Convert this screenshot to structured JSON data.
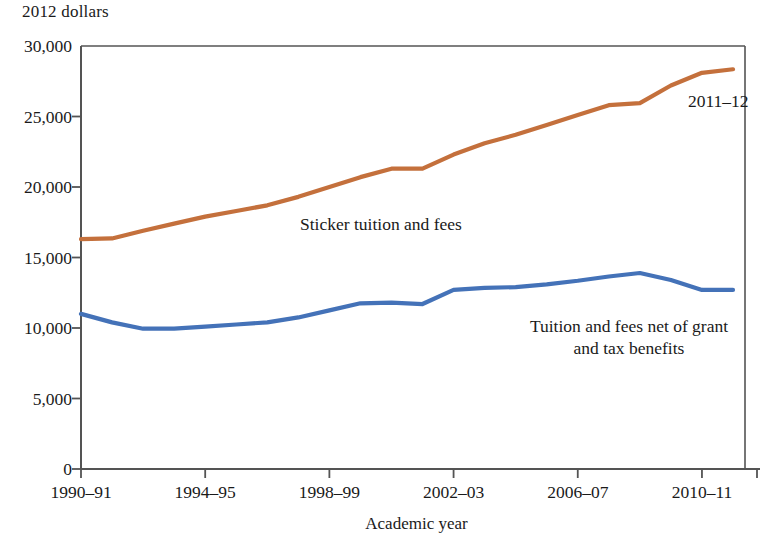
{
  "chart_data": {
    "type": "line",
    "title": "",
    "subtitle": "",
    "ylabel": "2012 dollars",
    "xlabel": "Academic year",
    "ylim": [
      0,
      30000
    ],
    "y_ticks": [
      0,
      5000,
      10000,
      15000,
      20000,
      25000,
      30000
    ],
    "y_tick_labels": [
      "0",
      "5,000",
      "10,000",
      "15,000",
      "20,000",
      "25,000",
      "30,000"
    ],
    "grid": false,
    "legend_position": "inline-annotations",
    "x": [
      "1990-91",
      "1991-92",
      "1992-93",
      "1993-94",
      "1994-95",
      "1995-96",
      "1996-97",
      "1997-98",
      "1998-99",
      "1999-00",
      "2000-01",
      "2001-02",
      "2002-03",
      "2003-04",
      "2004-05",
      "2005-06",
      "2006-07",
      "2007-08",
      "2008-09",
      "2009-10",
      "2010-11",
      "2011-12"
    ],
    "x_tick_labels": [
      "1990–91",
      "1994–95",
      "1998–99",
      "2002–03",
      "2006–07",
      "2010–11"
    ],
    "x_tick_indices": [
      0,
      4,
      8,
      12,
      16,
      20
    ],
    "series": [
      {
        "name": "Sticker tuition and fees",
        "color": "#C4703C",
        "values": [
          16300,
          16350,
          16900,
          17400,
          17900,
          18300,
          18700,
          19300,
          20000,
          20700,
          21300,
          21300,
          22300,
          23100,
          23700,
          24400,
          25100,
          25800,
          25950,
          27200,
          28100,
          28350
        ]
      },
      {
        "name": "Tuition and fees net of grant and tax benefits",
        "color": "#4472B8",
        "values": [
          11000,
          10400,
          9950,
          9950,
          10100,
          10250,
          10400,
          10750,
          11250,
          11750,
          11800,
          11700,
          12700,
          12850,
          12900,
          13100,
          13350,
          13650,
          13900,
          13400,
          12700,
          12700
        ]
      }
    ],
    "annotations": [
      {
        "text": "Sticker tuition and fees",
        "series": "Sticker tuition and fees"
      },
      {
        "text": "Tuition and fees net of grant",
        "series": "Tuition and fees net of grant and tax benefits"
      },
      {
        "text": "and tax benefits",
        "series": "Tuition and fees net of grant and tax benefits"
      },
      {
        "text": "2011–12",
        "series": "Sticker tuition and fees"
      }
    ]
  },
  "labels": {
    "y_unit": "2012 dollars",
    "x_axis_title": "Academic year",
    "annotation_sticker": "Sticker tuition and fees",
    "annotation_net_line1": "Tuition and fees net of grant",
    "annotation_net_line2": "and tax benefits",
    "annotation_last_year": "2011–12"
  },
  "colors": {
    "sticker_line": "#C4703C",
    "net_line": "#4472B8",
    "axis": "#545454",
    "text": "#1a1a1a",
    "background": "#ffffff"
  }
}
